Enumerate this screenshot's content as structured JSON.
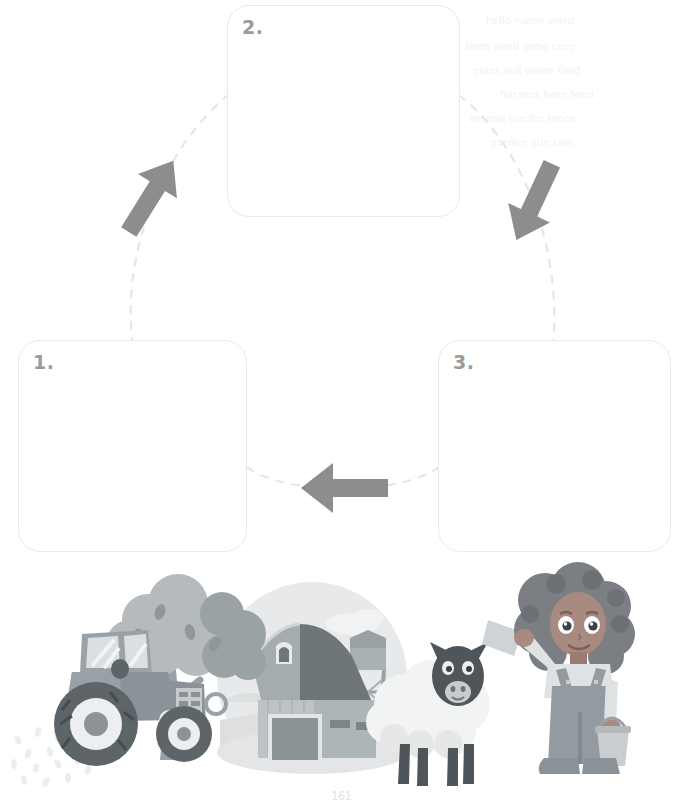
{
  "page": {
    "background_color": "#ffffff",
    "width": 683,
    "height": 803,
    "page_number": "161"
  },
  "cycle_diagram": {
    "name": "three-step-cycle",
    "box_border_color": "#e9eaeb",
    "number_color": "#9b9b9b",
    "arrow_color": "#8d8d8d",
    "dash_color": "#e6e6e7",
    "boxes": [
      {
        "id": "box1",
        "number": "1.",
        "content": ""
      },
      {
        "id": "box2",
        "number": "2.",
        "content": ""
      },
      {
        "id": "box3",
        "number": "3.",
        "content": ""
      }
    ],
    "connectors": [
      {
        "id": "arrow-box1-to-box2",
        "direction": "up-right",
        "from": "1",
        "to": "2"
      },
      {
        "id": "arrow-box2-to-box3",
        "direction": "down-right",
        "from": "2",
        "to": "3"
      },
      {
        "id": "arrow-box3-to-box1",
        "direction": "left",
        "from": "3",
        "to": "1"
      }
    ]
  },
  "illustration": {
    "name": "farm-scene",
    "description": "Farm scene with tractor, trees, barn, water tower, sheep and a girl farmer",
    "elements": [
      "tractor",
      "tree",
      "barn",
      "water-tower",
      "sheep",
      "girl-farmer",
      "shovel",
      "bucket",
      "seed-speckles"
    ],
    "colors": {
      "tractor_body": "#9aa3a8",
      "tractor_dark": "#6f777c",
      "tree_foliage": "#aab2b6",
      "barn_wall": "#b9bfc2",
      "barn_roof": "#8e9599",
      "sky_circle": "#e6e8e9",
      "ground": "#dcdedf",
      "sheep_wool": "#f1f2f2",
      "sheep_face": "#5e6569",
      "girl_skin": "#a9837a",
      "girl_hair": "#7d7f83",
      "girl_overalls": "#929aa0",
      "girl_shirt": "#dfe2e3"
    }
  },
  "scan_artifacts": {
    "name": "reverse-side-bleed-through",
    "color": "#f2f2f3",
    "lines": [
      "hello  name  word",
      "farm  seed  grow  crop",
      "plant  soil  water  field",
      "harvest  barn  feed",
      "animal  tractor  fence",
      "garden  sun  rain"
    ]
  }
}
